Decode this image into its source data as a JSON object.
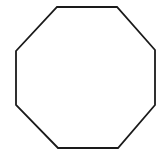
{
  "canvas": {
    "width": 164,
    "height": 157,
    "background_color": "#ffffff",
    "title": "Octagon"
  },
  "figure": {
    "name": "octagon",
    "shape_type": "regular-octagon",
    "sides": 8,
    "fill_color": "#ffffff",
    "stroke_color": "#1a1a1a",
    "stroke_width": 1.8,
    "stroke_linejoin": "miter",
    "vertices": [
      [
        57,
        7
      ],
      [
        117,
        7
      ],
      [
        155,
        50
      ],
      [
        155,
        105
      ],
      [
        118,
        148
      ],
      [
        58,
        148
      ],
      [
        16,
        105
      ],
      [
        16,
        51
      ]
    ],
    "points_string": "57,7 117,7 155,50 155,105 118,148 58,148 16,105 16,51",
    "bounding_box": {
      "x": 16,
      "y": 7,
      "width": 139,
      "height": 141
    },
    "center": [
      85.5,
      77.5
    ]
  }
}
